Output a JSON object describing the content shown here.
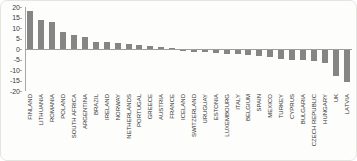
{
  "chart_data": {
    "type": "bar",
    "title": "",
    "xlabel": "",
    "ylabel": "",
    "legend_position": "none",
    "grid": "off",
    "ylim": [
      -20,
      20
    ],
    "ytick_labels": [
      "20",
      "15",
      "10",
      "5",
      "0",
      "-5",
      "-10",
      "-15",
      "-20"
    ],
    "ytick_values": [
      20,
      15,
      10,
      5,
      0,
      -5,
      -10,
      -15,
      -20
    ],
    "bar_color": "#858585",
    "axis_color": "#a8a8a8",
    "text_color": "#2e2e2e",
    "categories": [
      "FINLAND",
      "LITHUANIA",
      "ROMANIA",
      "POLAND",
      "SOUTH AFRICA",
      "ARGENTINA",
      "BRAZIL",
      "IRELAND",
      "NORWAY",
      "NETHERLANDS",
      "PORTUGAL",
      "GREECE",
      "AUSTRIA",
      "FRANCE",
      "ICELAND",
      "SWITZERLAND",
      "URUGUAY",
      "ESTONIA",
      "LUXEMBOURG",
      "ITALY",
      "BELGIUM",
      "SPAIN",
      "MEXICO",
      "TURKEY",
      "CYPRUS",
      "BULGARIA",
      "CZECH REPUBLIC",
      "HUNGARY",
      "UK",
      "LATVIA"
    ],
    "values": [
      18,
      14,
      13,
      8,
      6.5,
      5.5,
      3.5,
      3.2,
      3,
      2.5,
      1.8,
      1.2,
      1,
      0.3,
      -0.5,
      -0.9,
      -1.1,
      -1.4,
      -1.7,
      -2.1,
      -2.6,
      -2.9,
      -3.4,
      -4.2,
      -4.6,
      -4.9,
      -5.2,
      -6.2,
      -12.5,
      -15
    ]
  }
}
